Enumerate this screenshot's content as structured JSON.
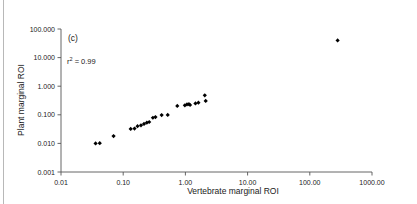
{
  "panel": {
    "label": "(c)"
  },
  "annotation": {
    "r_symbol": "r",
    "r_exponent": "2",
    "r_value": " = 0.99",
    "full_text": "r2 = 0.99"
  },
  "chart_data": {
    "type": "scatter",
    "title": "",
    "xlabel": "Vertebrate marginal ROI",
    "ylabel": "Plant marginal ROI",
    "xscale": "log",
    "yscale": "log",
    "xlim": [
      0.01,
      1000.0
    ],
    "ylim": [
      0.001,
      100.0
    ],
    "grid": false,
    "legend": null,
    "xticks": [
      0.01,
      0.1,
      1.0,
      10.0,
      100.0,
      1000.0
    ],
    "xticklabels": [
      "0.01",
      "0.10",
      "1.00",
      "10.00",
      "100.00",
      "1000.00"
    ],
    "yticks": [
      0.001,
      0.01,
      0.1,
      1.0,
      10.0,
      100.0
    ],
    "yticklabels": [
      "0.001",
      "0.010",
      "0.100",
      "1.000",
      "10.000",
      "100.000"
    ],
    "marker": "diamond",
    "marker_color": "#000000",
    "points": [
      {
        "x": 0.036,
        "y": 0.01
      },
      {
        "x": 0.042,
        "y": 0.0102
      },
      {
        "x": 0.07,
        "y": 0.018
      },
      {
        "x": 0.132,
        "y": 0.032
      },
      {
        "x": 0.152,
        "y": 0.033
      },
      {
        "x": 0.17,
        "y": 0.04
      },
      {
        "x": 0.193,
        "y": 0.043
      },
      {
        "x": 0.216,
        "y": 0.048
      },
      {
        "x": 0.24,
        "y": 0.053
      },
      {
        "x": 0.262,
        "y": 0.056
      },
      {
        "x": 0.3,
        "y": 0.079
      },
      {
        "x": 0.33,
        "y": 0.083
      },
      {
        "x": 0.415,
        "y": 0.098
      },
      {
        "x": 0.52,
        "y": 0.099
      },
      {
        "x": 0.74,
        "y": 0.205
      },
      {
        "x": 0.98,
        "y": 0.215
      },
      {
        "x": 1.06,
        "y": 0.23
      },
      {
        "x": 1.14,
        "y": 0.235
      },
      {
        "x": 1.19,
        "y": 0.22
      },
      {
        "x": 1.45,
        "y": 0.25
      },
      {
        "x": 1.62,
        "y": 0.265
      },
      {
        "x": 2.05,
        "y": 0.48
      },
      {
        "x": 2.12,
        "y": 0.305
      },
      {
        "x": 280.0,
        "y": 40.0
      }
    ]
  }
}
